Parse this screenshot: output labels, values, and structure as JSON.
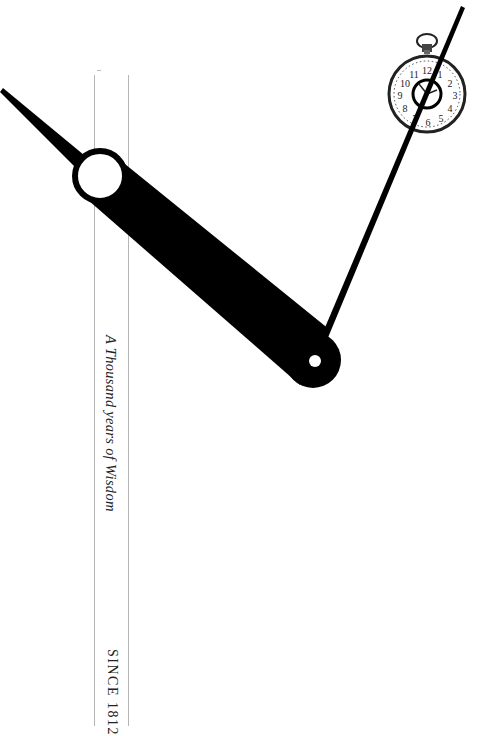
{
  "poster": {
    "tagline": "A Thousand years of Wisdom",
    "since": "SINCE 1812"
  },
  "icons": {
    "pocket_watch": "pocket-watch-icon",
    "clock_hands": "clock-hands-graphic"
  },
  "watch_numerals": [
    "12",
    "1",
    "2",
    "3",
    "4",
    "5",
    "6",
    "7",
    "8",
    "9",
    "10",
    "11"
  ],
  "colors": {
    "background": "#ffffff",
    "ink": "#000000",
    "rule_lines": "#b5b5b5"
  }
}
